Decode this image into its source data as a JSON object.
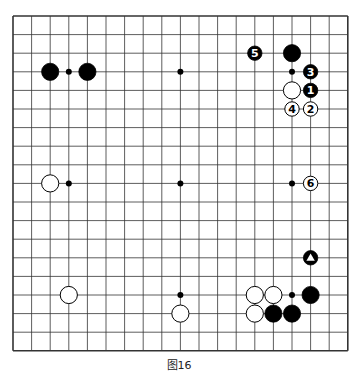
{
  "diagram": {
    "type": "go-board",
    "size": 19,
    "caption": "图16",
    "colors": {
      "line": "#333333",
      "black": "#000000",
      "white": "#ffffff",
      "background": "#ffffff"
    },
    "star_points": [
      [
        3,
        3
      ],
      [
        9,
        3
      ],
      [
        15,
        3
      ],
      [
        3,
        9
      ],
      [
        9,
        9
      ],
      [
        15,
        9
      ],
      [
        3,
        15
      ],
      [
        9,
        15
      ],
      [
        15,
        15
      ]
    ],
    "stones": [
      {
        "color": "black",
        "col": 2,
        "row": 3,
        "label": ""
      },
      {
        "color": "black",
        "col": 4,
        "row": 3,
        "label": ""
      },
      {
        "color": "black",
        "col": 13,
        "row": 2,
        "label": "5",
        "small": true
      },
      {
        "color": "black",
        "col": 15,
        "row": 2,
        "label": ""
      },
      {
        "color": "black",
        "col": 16,
        "row": 3,
        "label": "3",
        "small": true
      },
      {
        "color": "white",
        "col": 15,
        "row": 4,
        "label": ""
      },
      {
        "color": "black",
        "col": 16,
        "row": 4,
        "label": "1",
        "small": true
      },
      {
        "color": "white",
        "col": 15,
        "row": 5,
        "label": "4",
        "small": true
      },
      {
        "color": "white",
        "col": 16,
        "row": 5,
        "label": "2",
        "small": true
      },
      {
        "color": "white",
        "col": 2,
        "row": 9,
        "label": ""
      },
      {
        "color": "white",
        "col": 16,
        "row": 9,
        "label": "6",
        "small": true
      },
      {
        "color": "black",
        "col": 16,
        "row": 13,
        "label": "triangle",
        "small": true
      },
      {
        "color": "white",
        "col": 3,
        "row": 15,
        "label": ""
      },
      {
        "color": "white",
        "col": 9,
        "row": 16,
        "label": ""
      },
      {
        "color": "white",
        "col": 13,
        "row": 15,
        "label": ""
      },
      {
        "color": "white",
        "col": 14,
        "row": 15,
        "label": ""
      },
      {
        "color": "black",
        "col": 16,
        "row": 15,
        "label": ""
      },
      {
        "color": "white",
        "col": 13,
        "row": 16,
        "label": ""
      },
      {
        "color": "black",
        "col": 14,
        "row": 16,
        "label": ""
      },
      {
        "color": "black",
        "col": 15,
        "row": 16,
        "label": ""
      }
    ]
  }
}
